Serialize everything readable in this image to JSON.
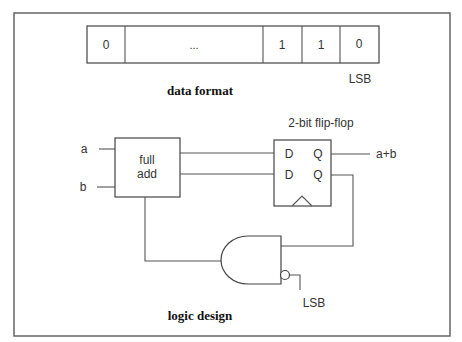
{
  "data_format": {
    "cells": [
      "0",
      "...",
      "1",
      "1",
      "0"
    ],
    "lsb_label": "LSB",
    "caption": "data format"
  },
  "logic_design": {
    "full_adder": {
      "label_line1": "full",
      "label_line2": "add",
      "input_a": "a",
      "input_b": "b"
    },
    "flip_flop": {
      "title": "2-bit flip-flop",
      "d1": "D",
      "d2": "D",
      "q1": "Q",
      "q2": "Q",
      "output": "a+b"
    },
    "gate": {
      "type": "AND with inverted input",
      "inverted_input_label": "LSB"
    },
    "caption": "logic design"
  }
}
